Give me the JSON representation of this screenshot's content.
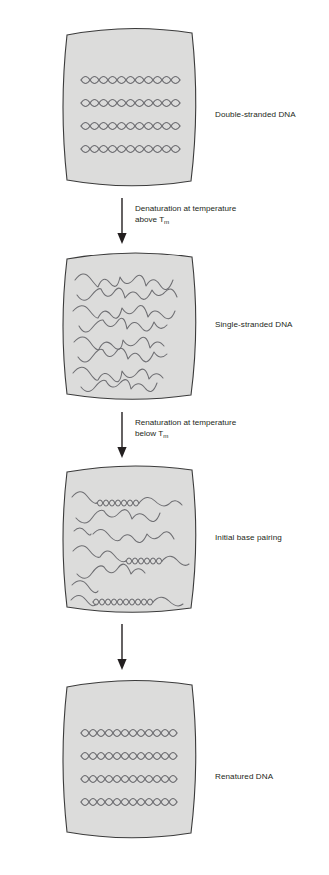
{
  "figure": {
    "background_color": "#ffffff",
    "panel_fill": "#dcdcdb",
    "panel_stroke": "#3b3b3b",
    "strand_color": "#6e6e72",
    "text_color": "#231f20"
  },
  "panels": [
    {
      "id": "double-stranded",
      "label": "Double-stranded DNA",
      "state": "duplex",
      "strand_count": 4,
      "description": "Four fully base-paired double helices lying parallel"
    },
    {
      "id": "single-stranded",
      "label": "Single-stranded DNA",
      "state": "denatured",
      "strand_count": 8,
      "description": "Separated irregular wavy single strands"
    },
    {
      "id": "initial-base-pairing",
      "label": "Initial base pairing",
      "state": "partially-renatured",
      "strand_count": 8,
      "description": "Wavy single strands with short helical paired regions"
    },
    {
      "id": "renatured",
      "label": "Renatured DNA",
      "state": "duplex",
      "strand_count": 4,
      "description": "Four fully re-formed double helices"
    }
  ],
  "steps": [
    {
      "id": "denaturation",
      "line1": "Denaturation at temperature",
      "line2_prefix": "above T",
      "line2_sub": "m",
      "arrow": "arrow-down-icon"
    },
    {
      "id": "renaturation",
      "line1": "Renaturation at temperature",
      "line2_prefix": "below T",
      "line2_sub": "m",
      "arrow": "arrow-down-icon"
    },
    {
      "id": "completion",
      "line1": "",
      "line2_prefix": "",
      "line2_sub": "",
      "arrow": "arrow-down-icon"
    }
  ]
}
